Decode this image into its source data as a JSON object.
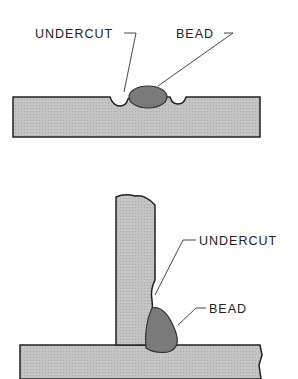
{
  "diagrams": [
    {
      "name": "butt-weld-undercut",
      "labels": {
        "undercut": "UNDERCUT",
        "bead": "BEAD"
      }
    },
    {
      "name": "fillet-weld-undercut",
      "labels": {
        "undercut": "UNDERCUT",
        "bead": "BEAD"
      }
    }
  ],
  "colors": {
    "plate": "#bdbdbd",
    "bead": "#7a7a7a",
    "outline": "#222222"
  }
}
